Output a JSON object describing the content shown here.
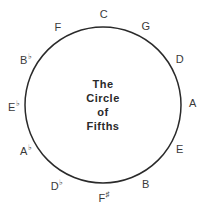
{
  "title": {
    "lines": [
      "The",
      "Circle",
      "of",
      "Fifths"
    ]
  },
  "circle": {
    "cx": 103,
    "cy": 105,
    "r": 78,
    "stroke": "#2a2a2a"
  },
  "notes": [
    {
      "name": "C",
      "base": "C",
      "accidental": "",
      "x": 104,
      "y": 14
    },
    {
      "name": "G",
      "base": "G",
      "accidental": "",
      "x": 146,
      "y": 26
    },
    {
      "name": "D",
      "base": "D",
      "accidental": "",
      "x": 180,
      "y": 59
    },
    {
      "name": "A",
      "base": "A",
      "accidental": "",
      "x": 193,
      "y": 103
    },
    {
      "name": "E",
      "base": "E",
      "accidental": "",
      "x": 180,
      "y": 149
    },
    {
      "name": "B",
      "base": "B",
      "accidental": "",
      "x": 146,
      "y": 184
    },
    {
      "name": "F-sharp",
      "base": "F",
      "accidental": "♯",
      "x": 104,
      "y": 198
    },
    {
      "name": "D-flat",
      "base": "D",
      "accidental": "♭",
      "x": 57,
      "y": 186
    },
    {
      "name": "A-flat",
      "base": "A",
      "accidental": "♭",
      "x": 26,
      "y": 151
    },
    {
      "name": "E-flat",
      "base": "E",
      "accidental": "♭",
      "x": 14,
      "y": 107
    },
    {
      "name": "B-flat",
      "base": "B",
      "accidental": "♭",
      "x": 26,
      "y": 60
    },
    {
      "name": "F",
      "base": "F",
      "accidental": "",
      "x": 58,
      "y": 27
    }
  ]
}
